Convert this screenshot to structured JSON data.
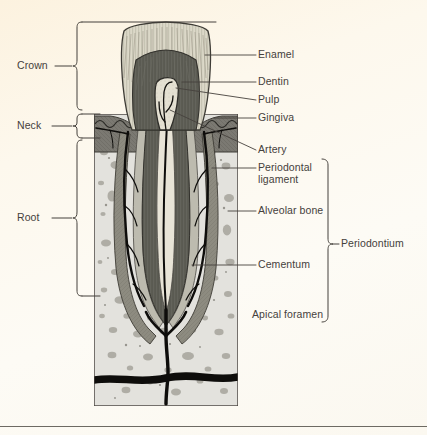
{
  "figure": {
    "type": "anatomical-diagram",
    "background_color": "#fdf8ee",
    "line_color": "#45413c"
  },
  "colors": {
    "enamel": "#dcd8c9",
    "dentin": "#5a5a52",
    "pulp": "#e6e2d5",
    "gingiva": "#767469",
    "periodontal_ligament": "#8d8b80",
    "alveolar_bone": "#e3e2dd",
    "bone_speckle": "#9d9b94",
    "cementum": "#b6b4a8",
    "artery": "#100f0d",
    "outline": "#45413c",
    "background": "#fdf8ee"
  },
  "left_labels": [
    {
      "id": "crown",
      "label": "Crown",
      "x": 17,
      "y": 66
    },
    {
      "id": "neck",
      "label": "Neck",
      "x": 17,
      "y": 126
    },
    {
      "id": "root",
      "label": "Root",
      "x": 17,
      "y": 218
    }
  ],
  "right_labels": [
    {
      "id": "enamel",
      "label": "Enamel",
      "x": 258,
      "y": 47
    },
    {
      "id": "dentin",
      "label": "Dentin",
      "x": 258,
      "y": 74
    },
    {
      "id": "pulp",
      "label": "Pulp",
      "x": 258,
      "y": 92
    },
    {
      "id": "gingiva",
      "label": "Gingiva",
      "x": 258,
      "y": 110
    },
    {
      "id": "artery",
      "label": "Artery",
      "x": 258,
      "y": 142
    },
    {
      "id": "periodontal-ligament",
      "label": "Periodontal\nligament",
      "x": 258,
      "y": 160
    },
    {
      "id": "alveolar-bone",
      "label": "Alveolar bone",
      "x": 258,
      "y": 203
    },
    {
      "id": "cementum",
      "label": "Cementum",
      "x": 258,
      "y": 258
    },
    {
      "id": "apical-foramen",
      "label": "Apical foramen",
      "x": 252,
      "y": 313
    }
  ],
  "group_labels": [
    {
      "id": "periodontium",
      "label": "Periodontium",
      "x": 341,
      "y": 240
    }
  ]
}
